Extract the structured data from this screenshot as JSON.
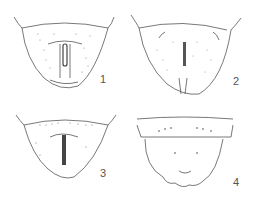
{
  "plate": {
    "figures": [
      {
        "number": "1",
        "description": "tergite with central slit, dotted"
      },
      {
        "number": "2",
        "description": "tergite with central bar and lateral hooks, setose margins"
      },
      {
        "number": "3",
        "description": "tergite with central slit and dotted anterior row"
      },
      {
        "number": "4",
        "description": "segment with lobed posterior margin and setose sides"
      }
    ]
  },
  "colors": {
    "ink": "#555555",
    "stipple": "#888888",
    "background": "#ffffff"
  }
}
